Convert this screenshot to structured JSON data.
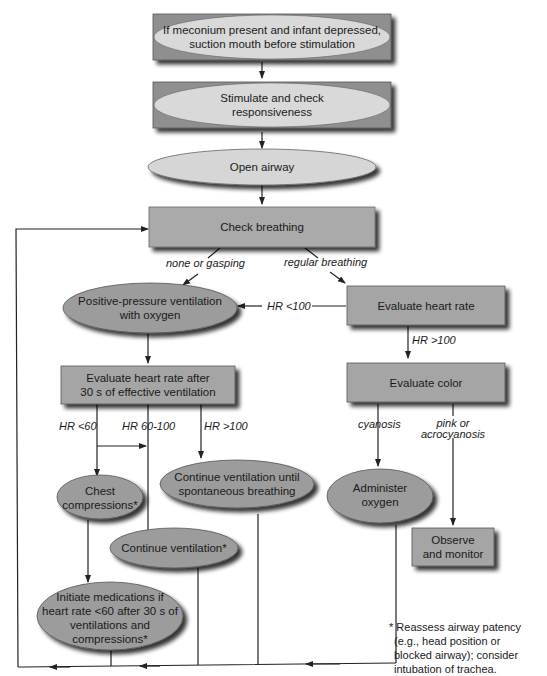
{
  "colors": {
    "box_fill": "#a7a7a7",
    "ellipse_light_fill": "#d9d9d9",
    "ellipse_dark_fill": "#9a9a9a",
    "shadow": "#2a2a2a",
    "line": "#222222"
  },
  "nodes": {
    "meconium": {
      "lines": [
        "If meconium present and infant depressed,",
        "suction mouth before stimulation"
      ]
    },
    "stimulate": {
      "lines": [
        "Stimulate and check",
        "responsiveness"
      ]
    },
    "open_airway": {
      "lines": [
        "Open airway"
      ]
    },
    "check_breathing": {
      "lines": [
        "Check breathing"
      ]
    },
    "ppv": {
      "lines": [
        "Positive-pressure ventilation",
        "with oxygen"
      ]
    },
    "eval_hr": {
      "lines": [
        "Evaluate heart rate"
      ]
    },
    "eval_hr_after": {
      "lines": [
        "Evaluate heart rate after",
        "30 s of effective ventilation"
      ]
    },
    "eval_color": {
      "lines": [
        "Evaluate color"
      ]
    },
    "chest_comp": {
      "lines": [
        "Chest",
        "compressions*"
      ]
    },
    "continue_until": {
      "lines": [
        "Continue ventilation until",
        "spontaneous breathing"
      ]
    },
    "administer_o2": {
      "lines": [
        "Administer",
        "oxygen"
      ]
    },
    "observe": {
      "lines": [
        "Observe",
        "and monitor"
      ]
    },
    "continue_vent": {
      "lines": [
        "Continue ventilation*"
      ]
    },
    "medications": {
      "lines": [
        "Initiate medications if",
        "heart rate <60 after 30 s of",
        "ventilations and",
        "compressions*"
      ]
    }
  },
  "edge_labels": {
    "none_gasping": "none or gasping",
    "regular": "regular breathing",
    "hr_lt_100": "HR <100",
    "hr_gt_100_right": "HR >100",
    "hr_lt_60": "HR <60",
    "hr_60_100": "HR 60-100",
    "hr_gt_100_left": "HR >100",
    "cyanosis": "cyanosis",
    "pink_1": "pink or",
    "pink_2": "acrocyanosis"
  },
  "footnote": {
    "lines": [
      "* Reassess airway patency",
      "(e.g., head position or",
      "blocked airway); consider",
      "intubation of trachea."
    ]
  }
}
